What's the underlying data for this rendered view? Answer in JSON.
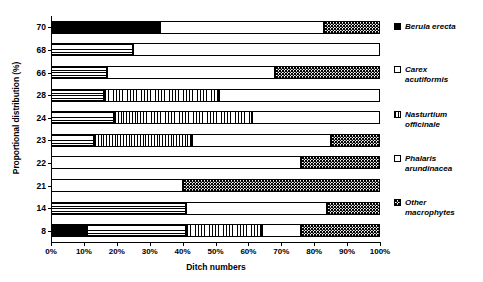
{
  "chart_data": {
    "type": "bar",
    "orientation": "horizontal",
    "stacked": true,
    "title": "",
    "xlabel": "Ditch numbers",
    "ylabel": "Proportional distribution (%)",
    "xlim": [
      0,
      100
    ],
    "xticks": [
      0,
      10,
      20,
      30,
      40,
      50,
      60,
      70,
      80,
      90,
      100
    ],
    "xticklabels": [
      "0%",
      "10%",
      "20%",
      "30%",
      "40%",
      "50%",
      "60%",
      "70%",
      "80%",
      "90%",
      "100%"
    ],
    "grid": false,
    "legend_position": "right",
    "categories": [
      "70",
      "68",
      "66",
      "28",
      "24",
      "23",
      "22",
      "21",
      "14",
      "8"
    ],
    "series": [
      {
        "name": "Berula erecta",
        "fill": "solid-black",
        "values": [
          33,
          0,
          0,
          0,
          0,
          0,
          0,
          0,
          0,
          11
        ]
      },
      {
        "name": "Carex acutiformis",
        "fill": "horizontal-lines",
        "values": [
          0,
          25,
          17,
          16,
          19,
          13,
          0,
          0,
          41,
          30
        ]
      },
      {
        "name": "Nasturtium officinale",
        "fill": "vertical-lines",
        "values": [
          0,
          0,
          0,
          35,
          42,
          30,
          0,
          0,
          0,
          23
        ]
      },
      {
        "name": "Phalaris arundinacea",
        "fill": "open-white",
        "values": [
          50,
          75,
          51,
          49,
          39,
          42,
          76,
          40,
          43,
          12
        ]
      },
      {
        "name": "Other macrophytes",
        "fill": "dotted",
        "values": [
          17,
          0,
          32,
          0,
          0,
          15,
          24,
          60,
          16,
          24
        ]
      }
    ]
  },
  "axes": {
    "y_title": "Proportional distribution (%)",
    "x_title": "Ditch numbers"
  },
  "legend": {
    "items": [
      {
        "label": "Berula erecta",
        "fill": "solid-black"
      },
      {
        "label": "Carex\nacutiformis",
        "fill": "open-white"
      },
      {
        "label": "Nasturtium\nofficinale",
        "fill": "vertical-lines"
      },
      {
        "label": "Phalaris\narundinacea",
        "fill": "open-white"
      },
      {
        "label": "Other\nmacrophytes",
        "fill": "dotted"
      }
    ]
  },
  "colors": {
    "ink": "#000000",
    "paper": "#ffffff"
  }
}
